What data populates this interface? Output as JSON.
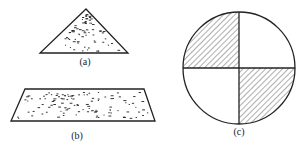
{
  "figure": {
    "panels": [
      {
        "id": "a",
        "label": "(a)",
        "shape": "triangle",
        "fill": "random-dots"
      },
      {
        "id": "b",
        "label": "(b)",
        "shape": "parallelogram",
        "fill": "random-dots"
      },
      {
        "id": "c",
        "label": "(c)",
        "shape": "circle-quadrants",
        "fill": "hatched top-left and bottom-right quadrants"
      }
    ]
  },
  "colors": {
    "stroke": "#222222",
    "background": "#ffffff"
  }
}
